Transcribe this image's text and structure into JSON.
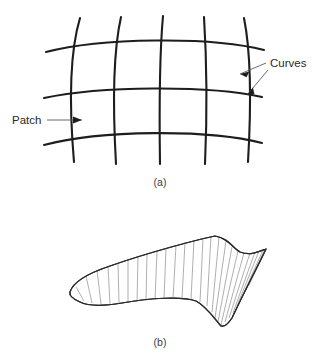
{
  "figure": {
    "panels": [
      {
        "id": "panel-a",
        "caption": "(a)",
        "caption_x": 160,
        "caption_y": 186,
        "description": "Curvilinear mesh of intersecting curves forming patches",
        "annotations": [
          {
            "name": "patch",
            "label": "Patch",
            "text_x": 12,
            "text_y": 124,
            "leader": "M 47 120 L 82 120",
            "arrow": "M 82 120 L 73 116.4 L 73 123.6 Z"
          },
          {
            "name": "curves",
            "label": "Curves",
            "text_x": 270,
            "text_y": 67,
            "leader_upper": "M 266 63 L 240 74",
            "arrow_upper": "M 240 74 L 249.3 71.6 L 246.5 77.3 Z",
            "leader_lower": "M 268 70 L 247 95",
            "arrow_lower": "M 247 95 L 252.9 87.5 L 254.4 94.1 Z"
          }
        ],
        "vertical_curves": [
          "M 80 18 C 71 48, 68 92, 74 162",
          "M 121 17 C 114 48, 112 94, 116 164",
          "M 163 16 C 160 49, 159 95, 160 164",
          "M 204 17 C 206 49, 208 95, 205 164",
          "M 244 18 C 250 48, 252 93, 248 162"
        ],
        "horizontal_curves": [
          "M 46 52 C 100 38, 210 36, 264 50",
          "M 44 98 C 100 86, 208 85, 262 97",
          "M 44 145 C 100 130, 208 129, 262 143"
        ]
      },
      {
        "id": "panel-b",
        "caption": "(b)",
        "caption_x": 160,
        "caption_y": 346,
        "description": "Lofted ruled surface with isoparametric ruling lines",
        "outline": "M 70 292 C 73 282, 86 274, 110 266 C 150 252, 196 240, 215 236 C 228 238, 233 248, 240 252 C 250 256, 258 252, 266 249 C 258 266, 244 292, 232 318 C 228 324, 224 327, 221 326 C 214 318, 206 306, 196 301 C 182 296, 150 298, 122 303 C 104 306, 88 306, 80 302 C 73 299, 69 296, 70 292 Z",
        "ruling_count": 26,
        "ruling_lines": [
          "M 76 287 L 84 301",
          "M 86 276 L 92 303",
          "M 97 270 L 101 304",
          "M 108 266 L 110 304",
          "M 118 263 L 119 303",
          "M 128 260 L 128 303",
          "M 138 257 L 137 302",
          "M 147 254 L 146 301",
          "M 157 251 L 155 300",
          "M 166 248 L 164 299",
          "M 176 245 L 173 299",
          "M 185 242 L 182 299",
          "M 194 240 L 191 299",
          "M 203 238 L 200 302",
          "M 211 236 L 207 306",
          "M 219 237 L 212 312",
          "M 226 241 L 215 318",
          "M 232 247 L 218 322",
          "M 238 251 L 221 325",
          "M 244 253 L 225 322",
          "M 250 253 L 229 318",
          "M 255 252 L 233 313",
          "M 259 251 L 237 306",
          "M 263 250 L 241 299",
          "M 265 249 L 245 292",
          "M 266 249 L 249 285"
        ]
      }
    ]
  },
  "colors": {
    "curve_stroke": "#1d1d1d",
    "leader_stroke": "#5a5a5a",
    "text": "#2a2a2a",
    "surface_stroke": "#2a2a2a",
    "ruling_stroke": "#7d7d7d",
    "background": "#ffffff"
  }
}
